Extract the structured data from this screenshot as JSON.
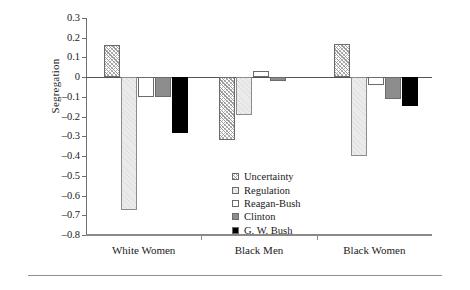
{
  "chart_data": {
    "type": "bar",
    "title": "",
    "xlabel": "",
    "ylabel": "Segregation",
    "ylim": [
      -0.8,
      0.3
    ],
    "ytick_values": [
      0.3,
      0.2,
      0.1,
      0,
      -0.1,
      -0.2,
      -0.3,
      -0.4,
      -0.5,
      -0.6,
      -0.7,
      -0.8
    ],
    "ytick_labels": [
      "0.3",
      "0.2",
      "0.1",
      "0",
      "–0.1",
      "–0.2",
      "–0.3",
      "–0.4",
      "–0.5",
      "–0.6",
      "–0.7",
      "–0.8"
    ],
    "categories": [
      "White Women",
      "Black Men",
      "Black Women"
    ],
    "grid": false,
    "legend_position": "inside-lower-right",
    "zero_line": true,
    "series": [
      {
        "name": "Uncertainty",
        "fill": "diagonal-crosshatch",
        "color": "#ffffff",
        "values": [
          0.165,
          -0.32,
          0.17
        ]
      },
      {
        "name": "Regulation",
        "fill": "light-hatch",
        "color": "#ebebeb",
        "values": [
          -0.675,
          -0.19,
          -0.4
        ]
      },
      {
        "name": "Reagan-Bush",
        "fill": "white-outline",
        "color": "#ffffff",
        "values": [
          -0.1,
          0.03,
          -0.04
        ]
      },
      {
        "name": "Clinton",
        "fill": "solid-gray",
        "color": "#8d8d8d",
        "values": [
          -0.1,
          -0.02,
          -0.11
        ]
      },
      {
        "name": "G. W. Bush",
        "fill": "solid-black",
        "color": "#000000",
        "values": [
          -0.285,
          null,
          -0.145
        ]
      }
    ]
  },
  "legend": {
    "items": [
      {
        "label": "Uncertainty"
      },
      {
        "label": "Regulation"
      },
      {
        "label": "Reagan-Bush"
      },
      {
        "label": "Clinton"
      },
      {
        "label": "G. W. Bush"
      }
    ]
  }
}
